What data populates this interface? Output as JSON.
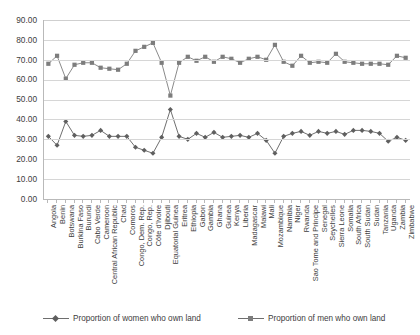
{
  "chart_data": {
    "type": "line",
    "title": "",
    "xlabel": "",
    "ylabel": "",
    "ylim": [
      0,
      90
    ],
    "ytick_step": 10,
    "ytick_labels": [
      "0.00",
      "10.00",
      "20.00",
      "30.00",
      "40.00",
      "50.00",
      "60.00",
      "70.00",
      "80.00",
      "90.00"
    ],
    "grid": true,
    "legend_position": "bottom",
    "categories": [
      "Angola",
      "Benin",
      "Botswana",
      "Burkina Faso",
      "Burundi",
      "Cabo Verde",
      "Cameroon",
      "Central African Republic",
      "Chad",
      "Comoros",
      "Congo, Dem. Rep.",
      "Congo, Rep.",
      "Côte d'Ivoire",
      "Djibouti",
      "Equatorial Guinea",
      "Eritrea",
      "Ethiopia",
      "Gabon",
      "Gambia",
      "Ghana",
      "Guinea",
      "Kenya",
      "Liberia",
      "Madagascar",
      "Malawi",
      "Mali",
      "Mozambique",
      "Namibia",
      "Niger",
      "Rwanda",
      "Sao Tome and Principe",
      "Senegal",
      "Seychelles",
      "Sierra Leone",
      "Somalia",
      "South Africa",
      "South Sudan",
      "Sudan",
      "Tanzania",
      "Uganda",
      "Zambia",
      "Zimbabwe"
    ],
    "series": [
      {
        "name": "Proportion of women who own land",
        "marker": "diamond",
        "color": "#5f5f5f",
        "values": [
          31.5,
          27.0,
          39.0,
          32.0,
          31.5,
          32.0,
          34.5,
          31.5,
          31.5,
          31.5,
          26.0,
          24.5,
          23.0,
          31.0,
          45.0,
          31.5,
          30.0,
          33.0,
          31.0,
          33.5,
          31.0,
          31.5,
          32.0,
          31.0,
          33.0,
          29.5,
          23.0,
          31.5,
          33.0,
          34.0,
          32.0,
          34.0,
          33.0,
          34.0,
          32.5,
          34.5,
          34.5,
          34.0,
          33.0,
          29.0,
          31.0,
          29.5
        ]
      },
      {
        "name": "Proportion of men who own land",
        "marker": "square",
        "color": "#7d7d7d",
        "values": [
          68.0,
          72.0,
          60.5,
          67.5,
          68.5,
          68.5,
          66.0,
          65.5,
          65.0,
          68.0,
          74.5,
          76.5,
          78.5,
          68.5,
          52.0,
          68.5,
          71.5,
          69.5,
          71.5,
          69.0,
          71.5,
          70.5,
          68.5,
          70.5,
          71.5,
          70.0,
          77.5,
          69.0,
          67.0,
          72.0,
          68.5,
          69.0,
          68.5,
          73.0,
          69.0,
          68.5,
          68.0,
          68.0,
          68.0,
          67.5,
          72.0,
          71.0
        ]
      }
    ]
  },
  "legend": {
    "women_label": "Proportion of women who own land",
    "men_label": "Proportion of men who own land"
  }
}
